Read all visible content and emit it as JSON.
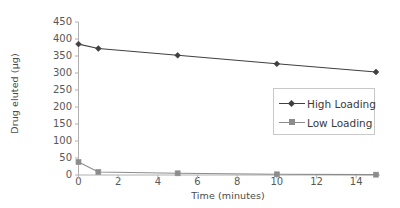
{
  "chart_data": {
    "type": "line",
    "title": "",
    "xlabel": "Time (minutes)",
    "ylabel": "Drug eluted (µg)",
    "x": [
      0,
      1,
      5,
      10,
      15
    ],
    "xlim": [
      0,
      15
    ],
    "ylim": [
      0,
      450
    ],
    "xticks": [
      0,
      2,
      4,
      6,
      8,
      10,
      12,
      14
    ],
    "yticks": [
      0,
      50,
      100,
      150,
      200,
      250,
      300,
      350,
      400,
      450
    ],
    "grid": false,
    "legend_position": "inside-right",
    "series": [
      {
        "name": "High Loading",
        "marker": "diamond",
        "color": "#404040",
        "values": [
          385,
          372,
          352,
          327,
          303
        ]
      },
      {
        "name": "Low Loading",
        "marker": "square",
        "color": "#8c8c8c",
        "values": [
          38,
          9,
          5,
          2,
          1
        ]
      }
    ]
  },
  "axes": {
    "y_tick_labels": [
      "450",
      "400",
      "350",
      "300",
      "250",
      "200",
      "150",
      "100",
      "50",
      "0"
    ],
    "x_tick_labels": [
      "0",
      "2",
      "4",
      "6",
      "8",
      "10",
      "12",
      "14"
    ],
    "y_title": "Drug eluted (µg)",
    "x_title": "Time (minutes)",
    "axis_color": "#b0b0b0"
  },
  "legend": {
    "entries": [
      {
        "label": "High Loading",
        "marker": "diamond",
        "color": "#404040"
      },
      {
        "label": "Low Loading",
        "marker": "square",
        "color": "#8c8c8c"
      }
    ]
  }
}
